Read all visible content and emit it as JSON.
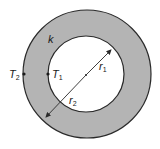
{
  "diagram": {
    "colors": {
      "shell_fill": "#b4b4b4",
      "outline": "#2a2a2a",
      "background": "#ffffff",
      "inner": "#ffffff"
    },
    "labels": {
      "conductivity": "k",
      "outer_temp": "T",
      "outer_temp_sub": "2",
      "inner_temp": "T",
      "inner_temp_sub": "1",
      "inner_radius": "r",
      "inner_radius_sub": "1",
      "outer_radius": "r",
      "outer_radius_sub": "2"
    }
  }
}
